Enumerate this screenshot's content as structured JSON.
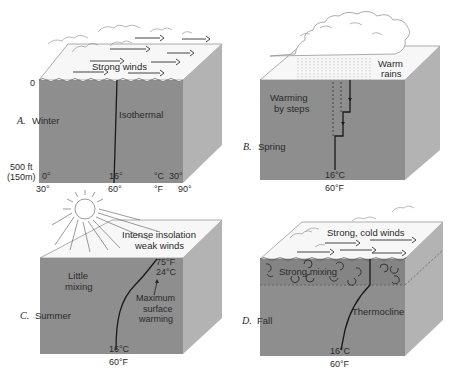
{
  "panels": [
    {
      "id": "A",
      "letter": "A.",
      "season": "Winter",
      "labels": {
        "weather": "Strong winds",
        "profile": "Isothermal"
      },
      "depth_axis": {
        "top": "0",
        "bottom_ft": "500 ft",
        "bottom_m": "(150m)"
      },
      "temp_axis_c": [
        "0°",
        "16°",
        "°C",
        "30°"
      ],
      "temp_axis_f": [
        "30°",
        "60°",
        "°F",
        "90°"
      ]
    },
    {
      "id": "B",
      "letter": "B.",
      "season": "Spring",
      "labels": {
        "weather_line1": "Warm",
        "weather_line2": "rains",
        "profile_line1": "Warming",
        "profile_line2": "by steps"
      },
      "bottom_c": "16°C",
      "bottom_f": "60°F"
    },
    {
      "id": "C",
      "letter": "C.",
      "season": "Summer",
      "labels": {
        "weather_line1": "Intense insolation",
        "weather_line2": "weak winds",
        "mixing_line1": "Little",
        "mixing_line2": "mixing",
        "surface_f": "75°F",
        "surface_c": "24°C",
        "warming_line1": "Maximum",
        "warming_line2": "surface",
        "warming_line3": "warming"
      },
      "bottom_c": "16°C",
      "bottom_f": "60°F"
    },
    {
      "id": "D",
      "letter": "D.",
      "season": "Fall",
      "labels": {
        "weather": "Strong, cold winds",
        "mixing": "Strong mixing",
        "profile": "Thermocline"
      },
      "bottom_c": "16°C",
      "bottom_f": "60°F"
    }
  ],
  "colors": {
    "water_front": "#8e8e8e",
    "water_side": "#b3b3b3",
    "surface_top": "#f7f7f7",
    "line": "#1a1a1a"
  }
}
